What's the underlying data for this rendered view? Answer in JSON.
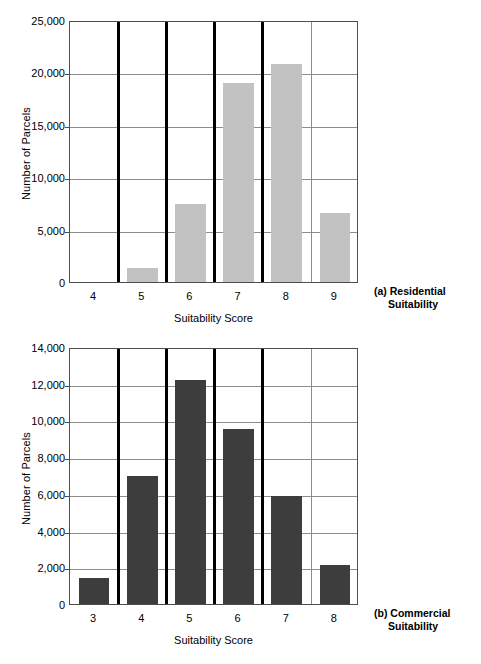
{
  "figure": {
    "panels": [
      "a",
      "b"
    ],
    "colors": {
      "bar_residential": "#c2c2c2",
      "bar_commercial": "#3d3d3d",
      "gridline": "#8c8c8c",
      "separator": "#000000",
      "axis": "#4d4d4d",
      "background": "#ffffff",
      "text": "#000000"
    }
  },
  "chart_data": [
    {
      "type": "bar",
      "panel": "a",
      "title": "",
      "caption_line1": "(a) Residential",
      "caption_line2": "Suitability",
      "xlabel": "Suitability Score",
      "ylabel": "Number of Parcels",
      "categories": [
        "4",
        "5",
        "6",
        "7",
        "8",
        "9"
      ],
      "values": [
        0,
        1300,
        7400,
        19000,
        20800,
        6600
      ],
      "ylim": [
        0,
        25000
      ],
      "ytick_values": [
        0,
        5000,
        10000,
        15000,
        20000,
        25000
      ],
      "ytick_labels": [
        "0",
        "5,000",
        "10,000",
        "15,000",
        "20,000",
        "25,000"
      ],
      "grid": true,
      "legend": "none",
      "bar_color": "#c2c2c2",
      "group_separators_after": [
        "4",
        "5",
        "6",
        "7"
      ],
      "minor_separators_after": [
        "8"
      ]
    },
    {
      "type": "bar",
      "panel": "b",
      "title": "",
      "caption_line1": "(b) Commercial",
      "caption_line2": "Suitability",
      "xlabel": "Suitability Score",
      "ylabel": "Number of Parcels",
      "categories": [
        "3",
        "4",
        "5",
        "6",
        "7",
        "8"
      ],
      "values": [
        1400,
        7000,
        12200,
        9550,
        5900,
        2100
      ],
      "ylim": [
        0,
        14000
      ],
      "ytick_values": [
        0,
        2000,
        4000,
        6000,
        8000,
        10000,
        12000,
        14000
      ],
      "ytick_labels": [
        "0",
        "2,000",
        "4,000",
        "6,000",
        "8,000",
        "10,000",
        "12,000",
        "14,000"
      ],
      "grid": true,
      "legend": "none",
      "bar_color": "#3d3d3d",
      "group_separators_after": [
        "3",
        "4",
        "5",
        "6"
      ],
      "minor_separators_after": [
        "7"
      ]
    }
  ]
}
